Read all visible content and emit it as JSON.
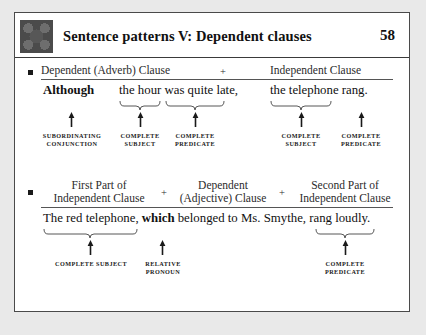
{
  "header": {
    "icon": "decorative-pattern-icon",
    "title": "Sentence patterns V: Dependent clauses",
    "page_number": "58"
  },
  "sections": [
    {
      "bullet": "square-bullet",
      "columns": [
        {
          "label": "Dependent (Adverb) Clause"
        },
        {
          "label": "+"
        },
        {
          "label": "Independent Clause"
        }
      ],
      "sentence_parts": [
        {
          "text": "Although",
          "bold": true
        },
        {
          "text": "the hour was quite late,",
          "bold": false
        },
        {
          "text": "the telephone rang.",
          "bold": false
        }
      ],
      "annotations": [
        {
          "tag_line1": "SUBORDINATING",
          "tag_line2": "CONJUNCTION",
          "brace": false
        },
        {
          "tag_line1": "COMPLETE",
          "tag_line2": "SUBJECT",
          "brace": true
        },
        {
          "tag_line1": "COMPLETE",
          "tag_line2": "PREDICATE",
          "brace": true
        },
        {
          "tag_line1": "COMPLETE",
          "tag_line2": "SUBJECT",
          "brace": true
        },
        {
          "tag_line1": "COMPLETE",
          "tag_line2": "PREDICATE",
          "brace": false
        }
      ]
    },
    {
      "bullet": "square-bullet",
      "columns": [
        {
          "line1": "First Part of",
          "line2": "Independent Clause"
        },
        {
          "label": "+"
        },
        {
          "line1": "Dependent",
          "line2": "(Adjective) Clause"
        },
        {
          "label": "+"
        },
        {
          "line1": "Second Part of",
          "line2": "Independent Clause"
        }
      ],
      "sentence_parts": [
        {
          "text": "The red telephone, ",
          "bold": false
        },
        {
          "text": "which",
          "bold": true
        },
        {
          "text": " belonged to Ms. Smythe, rang loudly.",
          "bold": false
        }
      ],
      "annotations": [
        {
          "tag_line1": "COMPLETE SUBJECT",
          "tag_line2": "",
          "brace": true
        },
        {
          "tag_line1": "RELATIVE",
          "tag_line2": "PRONOUN",
          "brace": false
        },
        {
          "tag_line1": "COMPLETE",
          "tag_line2": "PREDICATE",
          "brace": true
        }
      ]
    }
  ]
}
